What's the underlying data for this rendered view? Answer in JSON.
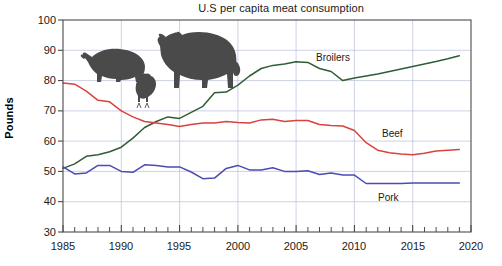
{
  "chart_data": {
    "type": "line",
    "title": "U.S per capita meat consumption",
    "xlabel": "",
    "ylabel": "Pounds",
    "xlim": [
      1985,
      2020
    ],
    "ylim": [
      30,
      100
    ],
    "grid": true,
    "legend_position": "inline-annotations",
    "xticks": [
      "1985",
      "1990",
      "1995",
      "2000",
      "2005",
      "2010",
      "2015",
      "2020"
    ],
    "yticks": [
      "30",
      "40",
      "50",
      "60",
      "70",
      "80",
      "90",
      "100"
    ],
    "x": [
      1985,
      1986,
      1987,
      1988,
      1989,
      1990,
      1991,
      1992,
      1993,
      1994,
      1995,
      1996,
      1997,
      1998,
      1999,
      2000,
      2001,
      2002,
      2003,
      2004,
      2005,
      2006,
      2007,
      2008,
      2009,
      2010,
      2011,
      2012,
      2013,
      2014,
      2015,
      2016,
      2017,
      2018,
      2019
    ],
    "series": [
      {
        "name": "Broilers",
        "color": "#2f5d35",
        "label_text": "Broilers",
        "values": [
          51.0,
          52.5,
          55.0,
          55.5,
          56.5,
          58.0,
          61.0,
          64.5,
          66.5,
          68.0,
          67.5,
          69.5,
          71.5,
          76.0,
          76.2,
          78.5,
          81.5,
          84.0,
          85.0,
          85.5,
          86.2,
          86.0,
          84.0,
          83.0,
          80.0,
          80.8,
          81.5,
          82.2,
          83.0,
          83.8,
          84.6,
          85.5,
          86.3,
          87.2,
          88.2
        ]
      },
      {
        "name": "Beef",
        "color": "#d8433e",
        "label_text": "Beef",
        "values": [
          79.2,
          78.8,
          76.5,
          73.5,
          73.0,
          70.0,
          68.0,
          66.5,
          66.0,
          65.5,
          64.8,
          65.5,
          66.0,
          66.0,
          66.5,
          66.2,
          66.0,
          67.0,
          67.2,
          66.5,
          66.8,
          66.8,
          65.5,
          65.2,
          65.0,
          63.5,
          59.5,
          57.0,
          56.2,
          55.8,
          55.5,
          56.0,
          56.7,
          57.0,
          57.2
        ]
      },
      {
        "name": "Pork",
        "color": "#4b4bb5",
        "label_text": "Pork",
        "values": [
          51.5,
          49.2,
          49.5,
          52.0,
          52.0,
          50.0,
          49.7,
          52.2,
          52.0,
          51.5,
          51.5,
          49.8,
          47.6,
          47.8,
          51.0,
          52.0,
          50.5,
          50.5,
          51.2,
          50.0,
          50.0,
          50.2,
          49.0,
          49.5,
          48.8,
          48.8,
          46.0,
          46.0,
          46.0,
          46.0,
          46.2,
          46.2,
          46.2,
          46.2,
          46.2
        ]
      }
    ],
    "annotations": [
      {
        "name": "pig-silhouette",
        "label": "pig"
      },
      {
        "name": "cow-silhouette",
        "label": "cow"
      },
      {
        "name": "chicken-silhouette",
        "label": "chicken"
      }
    ]
  }
}
